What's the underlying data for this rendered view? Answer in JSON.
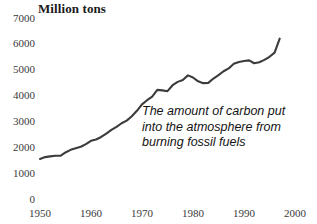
{
  "chart_data": {
    "type": "line",
    "title": "Million tons",
    "xlabel": "",
    "ylabel": "Million tons",
    "xlim": [
      1950,
      2000
    ],
    "ylim": [
      0,
      7000
    ],
    "ytick_labels": [
      "7000",
      "6000",
      "5000",
      "4000",
      "3000",
      "2000",
      "1000",
      "0"
    ],
    "ytick_values": [
      7000,
      6000,
      5000,
      4000,
      3000,
      2000,
      1000,
      0
    ],
    "xtick_labels": [
      "1950",
      "1960",
      "1970",
      "1980",
      "1990",
      "2000"
    ],
    "xtick_values": [
      1950,
      1960,
      1970,
      1980,
      1990,
      2000
    ],
    "grid": false,
    "legend": "none",
    "line_color": "#3c3c3c",
    "annotation": {
      "line1": "The amount of carbon put",
      "line2": "into the atmosphere from",
      "line3": "burning fossil fuels"
    },
    "series": [
      {
        "name": "Carbon emissions from burning fossil fuels",
        "x": [
          1950,
          1951,
          1952,
          1953,
          1954,
          1955,
          1956,
          1957,
          1958,
          1959,
          1960,
          1961,
          1962,
          1963,
          1964,
          1965,
          1966,
          1967,
          1968,
          1969,
          1970,
          1971,
          1972,
          1973,
          1974,
          1975,
          1976,
          1977,
          1978,
          1979,
          1980,
          1981,
          1982,
          1983,
          1984,
          1985,
          1986,
          1987,
          1988,
          1989,
          1990,
          1991,
          1992,
          1993,
          1994,
          1995,
          1996,
          1997
        ],
        "values": [
          1550,
          1620,
          1650,
          1670,
          1670,
          1800,
          1900,
          1960,
          2020,
          2120,
          2250,
          2300,
          2400,
          2530,
          2670,
          2790,
          2930,
          3030,
          3200,
          3410,
          3660,
          3820,
          3960,
          4220,
          4200,
          4170,
          4400,
          4530,
          4600,
          4780,
          4700,
          4550,
          4480,
          4490,
          4660,
          4790,
          4940,
          5050,
          5230,
          5300,
          5340,
          5360,
          5250,
          5290,
          5380,
          5500,
          5660,
          6200
        ]
      }
    ]
  }
}
